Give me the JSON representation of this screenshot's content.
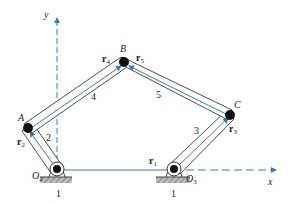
{
  "diagram": {
    "type": "five-bar linkage",
    "colors": {
      "link_outline": "#3a3a3a",
      "vector": "#3b7bb0",
      "axis": "#3b7bb0",
      "joint": "#111111",
      "ground": "#8a8a8a"
    },
    "axes": {
      "x_label": "x",
      "y_label": "y"
    },
    "joints": [
      {
        "id": "O2",
        "label": "O",
        "sub": "2"
      },
      {
        "id": "A",
        "label": "A"
      },
      {
        "id": "B",
        "label": "B"
      },
      {
        "id": "C",
        "label": "C"
      },
      {
        "id": "O3",
        "label": "O",
        "sub": "3"
      }
    ],
    "links": [
      {
        "number": "1",
        "name": "ground"
      },
      {
        "number": "2",
        "from": "O2",
        "to": "A"
      },
      {
        "number": "3",
        "from": "O3",
        "to": "C"
      },
      {
        "number": "4",
        "from": "A",
        "to": "B"
      },
      {
        "number": "5",
        "from": "B",
        "to": "C"
      }
    ],
    "vectors": [
      {
        "label": "r",
        "sub": "1"
      },
      {
        "label": "r",
        "sub": "2"
      },
      {
        "label": "r",
        "sub": "3"
      },
      {
        "label": "r",
        "sub": "4"
      },
      {
        "label": "r",
        "sub": "5"
      }
    ],
    "ground_labels": [
      "1",
      "1"
    ]
  }
}
